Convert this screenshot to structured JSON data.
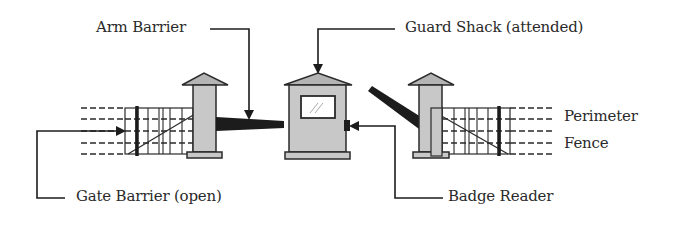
{
  "diagram": {
    "type": "physical-access-control-checkpoint",
    "labels": {
      "arm_barrier": "Arm Barrier",
      "guard_shack": "Guard Shack (attended)",
      "gate_barrier": "Gate Barrier (open)",
      "badge_reader": "Badge Reader",
      "perimeter_line1": "Perimeter",
      "perimeter_line2": "Fence"
    },
    "components": [
      {
        "id": "left-gate",
        "name": "Gate Barrier (open)",
        "state": "open"
      },
      {
        "id": "left-pillar",
        "name": "Gate pillar"
      },
      {
        "id": "arm-barrier-left",
        "name": "Arm Barrier",
        "state": "closed/horizontal"
      },
      {
        "id": "guard-shack",
        "name": "Guard Shack (attended)"
      },
      {
        "id": "badge-reader",
        "name": "Badge Reader"
      },
      {
        "id": "arm-barrier-right",
        "name": "Arm barrier",
        "state": "raised/angled"
      },
      {
        "id": "right-pillar",
        "name": "Gate pillar"
      },
      {
        "id": "right-gate",
        "name": "Gate"
      },
      {
        "id": "perimeter-fence",
        "name": "Perimeter Fence"
      }
    ],
    "colors": {
      "stroke": "#2a2a2a",
      "fill_gray": "#c8c8c8",
      "roof_gray": "#b4b4b4",
      "bar_black": "#1c1c1c",
      "background": "#ffffff"
    }
  }
}
